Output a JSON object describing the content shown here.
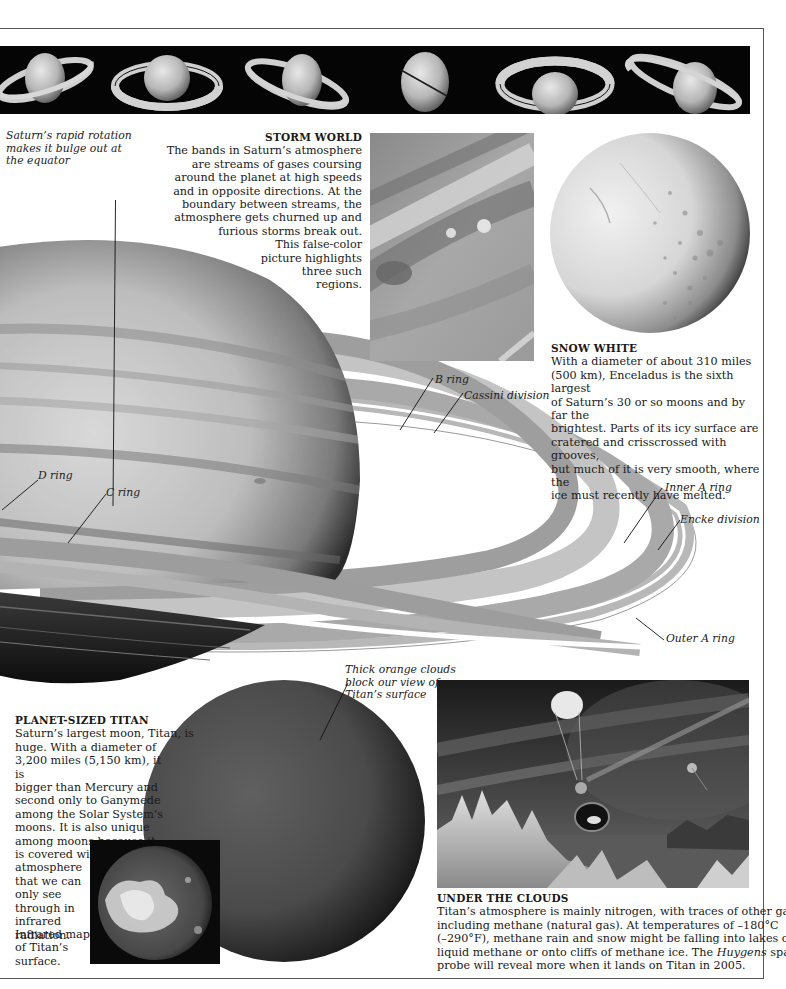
{
  "banner": {
    "label": "Saturn ring orientation sequence",
    "frames": [
      {
        "tilt": "tilted-left"
      },
      {
        "tilt": "face-on-top"
      },
      {
        "tilt": "tilted-right"
      },
      {
        "tilt": "edge-on"
      },
      {
        "tilt": "face-on-bottom"
      },
      {
        "tilt": "tilted-down-right"
      }
    ]
  },
  "annotations": {
    "rotation_note": "Saturn’s rapid rotation makes it bulge out at the equator",
    "rotation_note_lines": [
      "Saturn’s rapid rotation",
      "makes it bulge out at",
      "the equator"
    ],
    "titan_clouds_lines": [
      "Thick orange clouds",
      "block our view of",
      "Titan’s surface"
    ],
    "infrared_caption_lines": [
      "Infrared map",
      "of Titan’s",
      "surface."
    ]
  },
  "ring_labels": {
    "b_ring": "B ring",
    "cassini_division": "Cassini division",
    "d_ring": "D ring",
    "c_ring": "C ring",
    "inner_a_ring": "Inner A ring",
    "encke_division": "Encke division",
    "outer_a_ring": "Outer A ring"
  },
  "storm_world": {
    "title": "STORM WORLD",
    "lines": [
      "The bands in Saturn’s atmosphere",
      "are streams of gases coursing",
      "around the planet at high speeds",
      "and in opposite directions. At the",
      "boundary between streams, the",
      "atmosphere gets churned up and",
      "furious storms break out.",
      "This false-color",
      "picture highlights",
      "three such",
      "regions."
    ]
  },
  "snow_white": {
    "title": "SNOW WHITE",
    "lines": [
      "With a diameter of about 310 miles",
      "(500 km), Enceladus is the sixth largest",
      "of Saturn’s 30 or so moons and by far the",
      "brightest. Parts of its icy surface are",
      "cratered and crisscrossed with grooves,",
      "but much of it is very smooth, where the",
      "ice must recently have melted."
    ]
  },
  "planet_sized_titan": {
    "title": "PLANET-SIZED TITAN",
    "lines": [
      "Saturn’s largest moon, Titan, is",
      "huge. With a diameter of",
      "3,200 miles (5,150 km), it is",
      "bigger than Mercury and",
      "second only to Ganymede",
      "among the Solar System’s",
      "moons. It is also unique",
      "among moons because it",
      "is covered with a thick",
      "atmosphere",
      "that we can",
      "only see",
      "through in",
      "infrared",
      "radiation."
    ]
  },
  "under_the_clouds": {
    "title": "UNDER THE CLOUDS",
    "line1": "Titan’s atmosphere is mainly nitrogen, with traces of other gases,",
    "line2": "including methane (natural gas). At temperatures of –180°C",
    "line3": "(–290°F), methane rain and snow might be falling into lakes of",
    "line4_a": "liquid methane or onto cliffs of methane ice. The ",
    "line4_em": "Huygens",
    "line4_b": " space",
    "line5": "probe will reveal more when it lands on Titan in 2005."
  },
  "colors": {
    "frame": "#555555",
    "banner_bg": "#050505",
    "text": "#1a1a1a"
  }
}
